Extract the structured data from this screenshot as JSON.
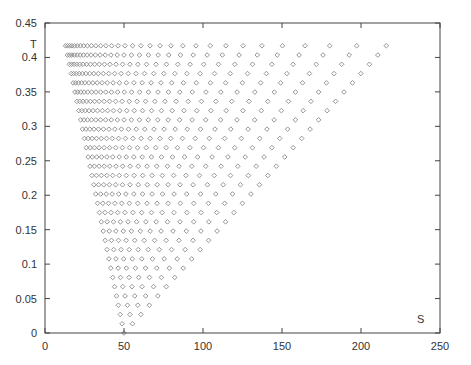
{
  "chart_data": {
    "type": "scatter",
    "title": "",
    "xlabel": "S",
    "ylabel": "T",
    "xlim": [
      0,
      250
    ],
    "ylim": [
      0,
      0.45
    ],
    "xticks": [
      0,
      50,
      100,
      150,
      200,
      250
    ],
    "yticks": [
      0,
      0.05,
      0.1,
      0.15,
      0.2,
      0.25,
      0.3,
      0.35,
      0.4,
      0.45
    ],
    "xtick_labels": [
      "0",
      "50",
      "100",
      "150",
      "200",
      "250"
    ],
    "ytick_labels": [
      "0",
      "0.05",
      "0.1",
      "0.15",
      "0.2",
      "0.25",
      "0.3",
      "0.35",
      "0.4",
      "0.45"
    ],
    "grid": false,
    "legend": null,
    "marker": "diamond",
    "marker_color": "#8a8a8a",
    "rows": {
      "count": 32,
      "t_step": 0.01345,
      "left_edge": {
        "at_T0": 50,
        "at_Ttop": 13
      },
      "right_edge": {
        "at_T0": 50,
        "at_Ttop": 216
      }
    }
  },
  "labels": {
    "x_axis": "S",
    "y_axis": "T"
  }
}
